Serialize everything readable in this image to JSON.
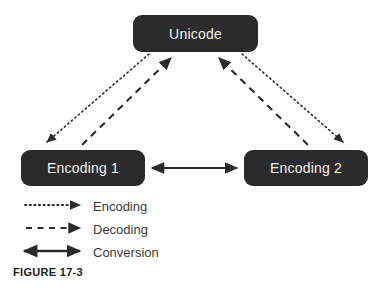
{
  "figure": {
    "caption": "FIGURE 17-3",
    "background_color": "#ffffff",
    "node_fill_color": "#2b2b2b",
    "node_text_color": "#f2f2f2",
    "line_color": "#2b2b2b"
  },
  "nodes": [
    {
      "id": "unicode",
      "label": "Unicode"
    },
    {
      "id": "encoding-1",
      "label": "Encoding 1"
    },
    {
      "id": "encoding-2",
      "label": "Encoding 2"
    }
  ],
  "legend": {
    "items": [
      {
        "label": "Encoding",
        "style": "dotted",
        "arrows": "single"
      },
      {
        "label": "Decoding",
        "style": "dashed",
        "arrows": "single"
      },
      {
        "label": "Conversion",
        "style": "solid",
        "arrows": "double"
      }
    ]
  },
  "edges": [
    {
      "from": "unicode",
      "to": "encoding-1",
      "style": "dotted",
      "meaning": "Encoding"
    },
    {
      "from": "unicode",
      "to": "encoding-2",
      "style": "dotted",
      "meaning": "Encoding"
    },
    {
      "from": "encoding-1",
      "to": "unicode",
      "style": "dashed",
      "meaning": "Decoding"
    },
    {
      "from": "encoding-2",
      "to": "unicode",
      "style": "dashed",
      "meaning": "Decoding"
    },
    {
      "from": "encoding-1",
      "to": "encoding-2",
      "style": "solid",
      "meaning": "Conversion",
      "arrows": "double"
    }
  ]
}
